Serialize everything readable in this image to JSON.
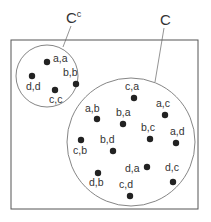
{
  "diagram": {
    "set_labels": {
      "complement": {
        "base": "C",
        "sup": "c"
      },
      "event": "C"
    },
    "complement_points": [
      {
        "label": "a,a",
        "dot": [
          47,
          62
        ],
        "text": [
          53,
          62
        ]
      },
      {
        "label": "b,b",
        "dot": [
          76,
          84
        ],
        "text": [
          63,
          76
        ]
      },
      {
        "label": "d,d",
        "dot": [
          32,
          76
        ],
        "text": [
          26,
          90
        ]
      },
      {
        "label": "c,c",
        "dot": [
          55,
          90
        ],
        "text": [
          49,
          103
        ]
      }
    ],
    "event_points": [
      {
        "label": "c,a",
        "dot": [
          134,
          98
        ],
        "text": [
          125,
          90
        ]
      },
      {
        "label": "a,c",
        "dot": [
          165,
          115
        ],
        "text": [
          156,
          107
        ]
      },
      {
        "label": "a,b",
        "dot": [
          97,
          119
        ],
        "text": [
          85,
          112
        ]
      },
      {
        "label": "b,a",
        "dot": [
          123,
          124
        ],
        "text": [
          116,
          116
        ]
      },
      {
        "label": "b,c",
        "dot": [
          150,
          139
        ],
        "text": [
          141,
          131
        ]
      },
      {
        "label": "a,d",
        "dot": [
          176,
          143
        ],
        "text": [
          170,
          135
        ]
      },
      {
        "label": "c,b",
        "dot": [
          81,
          140
        ],
        "text": [
          73,
          154
        ]
      },
      {
        "label": "b,d",
        "dot": [
          113,
          151
        ],
        "text": [
          100,
          143
        ]
      },
      {
        "label": "d,a",
        "dot": [
          147,
          167
        ],
        "text": [
          125,
          172
        ]
      },
      {
        "label": "d,c",
        "dot": [
          173,
          182
        ],
        "text": [
          165,
          171
        ]
      },
      {
        "label": "d,b",
        "dot": [
          98,
          173
        ],
        "text": [
          89,
          186
        ]
      },
      {
        "label": "c,d",
        "dot": [
          130,
          196
        ],
        "text": [
          119,
          188
        ]
      }
    ],
    "colors": {
      "stroke": "#555555",
      "dot": "#222222",
      "text": "#333333"
    }
  }
}
